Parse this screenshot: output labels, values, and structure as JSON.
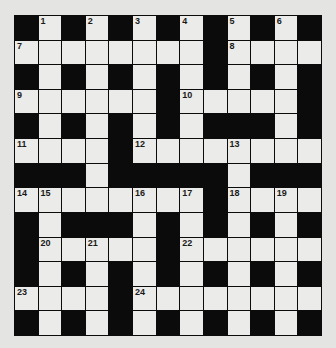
{
  "puzzle": {
    "type": "crossword",
    "rows": 13,
    "cols": 13,
    "colors": {
      "background": "#e4e4e2",
      "white_cell": "#ebebe9",
      "black_cell": "#0b0b0b",
      "number_text": "#1a1a1a"
    },
    "grid": [
      "#.#.#.#.#.#.#",
      "........#....",
      "#.#.#.#.#.#.#",
      "......#.....#",
      "#.#.#.#.###.#",
      "....#........",
      "###.#####.###",
      "........#....",
      "#.###.#.#.#.#",
      "#.....#......",
      "#.#.#.#.#.#.#",
      "....#........",
      "#.#.#.#.#.#.#"
    ],
    "numbers": [
      {
        "row": 0,
        "col": 1,
        "n": "1"
      },
      {
        "row": 0,
        "col": 3,
        "n": "2"
      },
      {
        "row": 0,
        "col": 5,
        "n": "3"
      },
      {
        "row": 0,
        "col": 7,
        "n": "4"
      },
      {
        "row": 0,
        "col": 9,
        "n": "5"
      },
      {
        "row": 0,
        "col": 11,
        "n": "6"
      },
      {
        "row": 1,
        "col": 0,
        "n": "7"
      },
      {
        "row": 1,
        "col": 9,
        "n": "8"
      },
      {
        "row": 3,
        "col": 0,
        "n": "9"
      },
      {
        "row": 3,
        "col": 7,
        "n": "10"
      },
      {
        "row": 5,
        "col": 0,
        "n": "11"
      },
      {
        "row": 5,
        "col": 5,
        "n": "12"
      },
      {
        "row": 5,
        "col": 9,
        "n": "13"
      },
      {
        "row": 7,
        "col": 0,
        "n": "14"
      },
      {
        "row": 7,
        "col": 1,
        "n": "15"
      },
      {
        "row": 7,
        "col": 5,
        "n": "16"
      },
      {
        "row": 7,
        "col": 7,
        "n": "17"
      },
      {
        "row": 7,
        "col": 9,
        "n": "18"
      },
      {
        "row": 7,
        "col": 11,
        "n": "19"
      },
      {
        "row": 9,
        "col": 1,
        "n": "20"
      },
      {
        "row": 9,
        "col": 3,
        "n": "21"
      },
      {
        "row": 9,
        "col": 7,
        "n": "22"
      },
      {
        "row": 11,
        "col": 0,
        "n": "23"
      },
      {
        "row": 11,
        "col": 5,
        "n": "24"
      }
    ]
  }
}
